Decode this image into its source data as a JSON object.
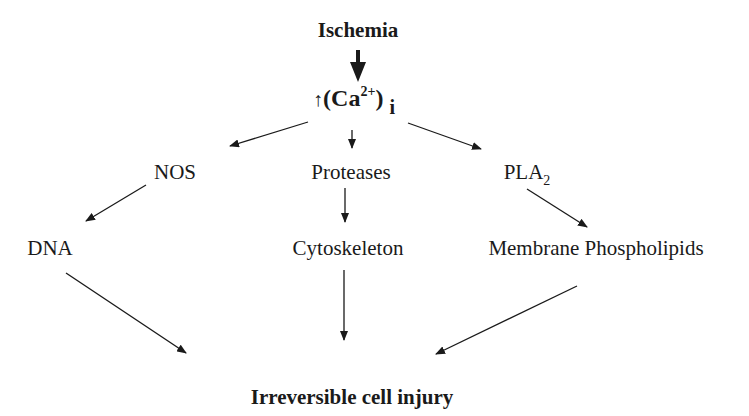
{
  "diagram": {
    "title": "Ischemia",
    "calcium": {
      "up_arrow": "↑",
      "open": "(Ca",
      "sup": "2+",
      "close": ")",
      "subscript": "i"
    },
    "level2": [
      {
        "label": "NOS"
      },
      {
        "label": "Proteases"
      },
      {
        "label": "PLA",
        "subscript": "2"
      }
    ],
    "level3": [
      {
        "label": "DNA"
      },
      {
        "label": "Cytoskeleton"
      },
      {
        "label": "Membrane Phospholipids"
      }
    ],
    "outcome": "Irreversible cell injury",
    "edges": [
      [
        "Ischemia",
        "(Ca2+)i"
      ],
      [
        "(Ca2+)i",
        "NOS"
      ],
      [
        "(Ca2+)i",
        "Proteases"
      ],
      [
        "(Ca2+)i",
        "PLA2"
      ],
      [
        "NOS",
        "DNA"
      ],
      [
        "Proteases",
        "Cytoskeleton"
      ],
      [
        "PLA2",
        "Membrane Phospholipids"
      ],
      [
        "DNA",
        "Irreversible cell injury"
      ],
      [
        "Cytoskeleton",
        "Irreversible cell injury"
      ],
      [
        "Membrane Phospholipids",
        "Irreversible cell injury"
      ]
    ],
    "colors": {
      "text": "#1a1a1a",
      "background": "#ffffff"
    }
  }
}
